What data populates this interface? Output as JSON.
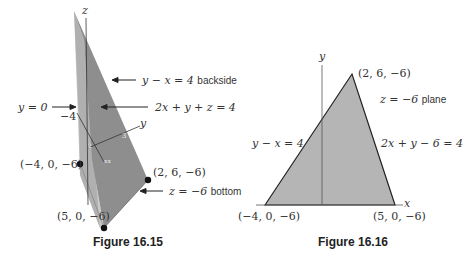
{
  "figure_left": {
    "caption": "Figure 16.15",
    "axis_z": "z",
    "axis_y": "y",
    "tick_minus4": "−4",
    "labels": {
      "backside": {
        "eq": "y − x = 4",
        "note": "backside"
      },
      "front_plane": {
        "eq": "2x + y + z = 4"
      },
      "y0": {
        "eq": "y = 0"
      },
      "bottom": {
        "eq": "z = −6",
        "note": "bottom"
      }
    },
    "points": [
      {
        "label": "(−4, 0, −6)"
      },
      {
        "label": "(2, 6, −6)"
      },
      {
        "label": "(5, 0, −6)"
      }
    ],
    "colors": {
      "light_face": "#b8b8b8",
      "dark_face": "#8c8c8c",
      "edge": "#555555"
    }
  },
  "figure_right": {
    "caption": "Figure 16.16",
    "axis_y": "y",
    "axis_x": "x",
    "labels": {
      "plane": {
        "eq": "z = −6",
        "note": "plane"
      },
      "left_edge": {
        "eq": "y − x = 4"
      },
      "right_edge": {
        "eq": "2x + y − 6 = 4"
      }
    },
    "points": [
      {
        "label": "(2, 6, −6)"
      },
      {
        "label": "(−4, 0, −6)"
      },
      {
        "label": "(5, 0, −6)"
      }
    ],
    "colors": {
      "fill": "#b3b3b3",
      "edge": "#222222"
    }
  }
}
